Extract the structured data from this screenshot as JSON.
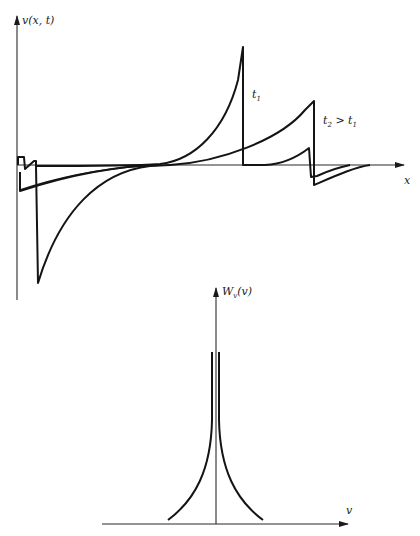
{
  "top_diagram": {
    "y_axis_label": "v(x, t)",
    "x_axis_label": "x",
    "curve_label_t1": "t",
    "curve_label_t1_sub": "1",
    "curve_label_t2_main": "t",
    "curve_label_t2_sub": "2",
    "curve_label_t2_rel": " > t",
    "curve_label_t2_rel_sub": "1"
  },
  "bottom_diagram": {
    "y_axis_label_main": "W",
    "y_axis_label_sub": "v",
    "y_axis_label_arg": "(v)",
    "x_axis_label": "v"
  },
  "colors": {
    "ink": "#141414",
    "background": "#ffffff"
  }
}
